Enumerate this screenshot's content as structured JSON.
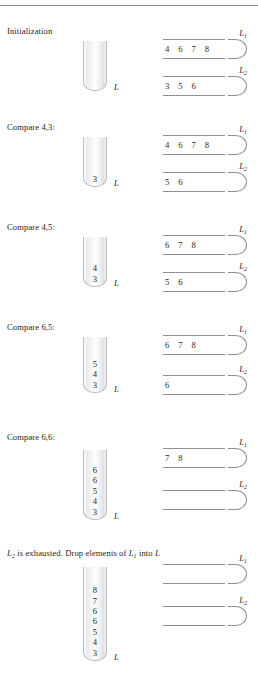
{
  "figure": {
    "top_rule": true,
    "stack_label": "L",
    "list_names": {
      "l1": "L",
      "l1_sub": "1",
      "l2": "L",
      "l2_sub": "2"
    }
  },
  "sections": [
    {
      "id": "initialization",
      "caption_pre": "Initialization",
      "caption_post": "",
      "stack": [],
      "list1": "4  6  7  8",
      "list2": "3  5  6"
    },
    {
      "id": "compare-4-3",
      "caption_pre": "Compare 4,3:",
      "caption_post": "",
      "stack": [
        "3"
      ],
      "list1": "4  6  7  8",
      "list2": "5  6"
    },
    {
      "id": "compare-4-5",
      "caption_pre": "Compare 4,5:",
      "caption_post": "",
      "stack": [
        "3",
        "4"
      ],
      "list1": "6  7  8",
      "list2": "5  6"
    },
    {
      "id": "compare-6-5",
      "caption_pre": "Compare 6,5:",
      "caption_post": "",
      "stack": [
        "3",
        "4",
        "5"
      ],
      "list1": "6  7  8",
      "list2": "6"
    },
    {
      "id": "compare-6-6",
      "caption_pre": "Compare 6,6:",
      "caption_post": "",
      "stack": [
        "3",
        "4",
        "5",
        "6",
        "6"
      ],
      "list1": "7  8",
      "list2": ""
    },
    {
      "id": "l2-exhausted",
      "caption_pre": "",
      "caption_post": "",
      "caption_rich": true,
      "caption_parts": {
        "a": "L",
        "a_sub": "2",
        "b": " is exhausted. Drop elements of ",
        "c": "L",
        "c_sub": "1",
        "d": " into ",
        "e": "L"
      },
      "stack": [
        "3",
        "4",
        "5",
        "6",
        "6",
        "7",
        "8"
      ],
      "list1": "",
      "list2": ""
    }
  ],
  "layout": {
    "sections_top": [
      28,
      122,
      222,
      322,
      432,
      548
    ],
    "caption_top": [
      0,
      0,
      0,
      0,
      0,
      0
    ]
  }
}
